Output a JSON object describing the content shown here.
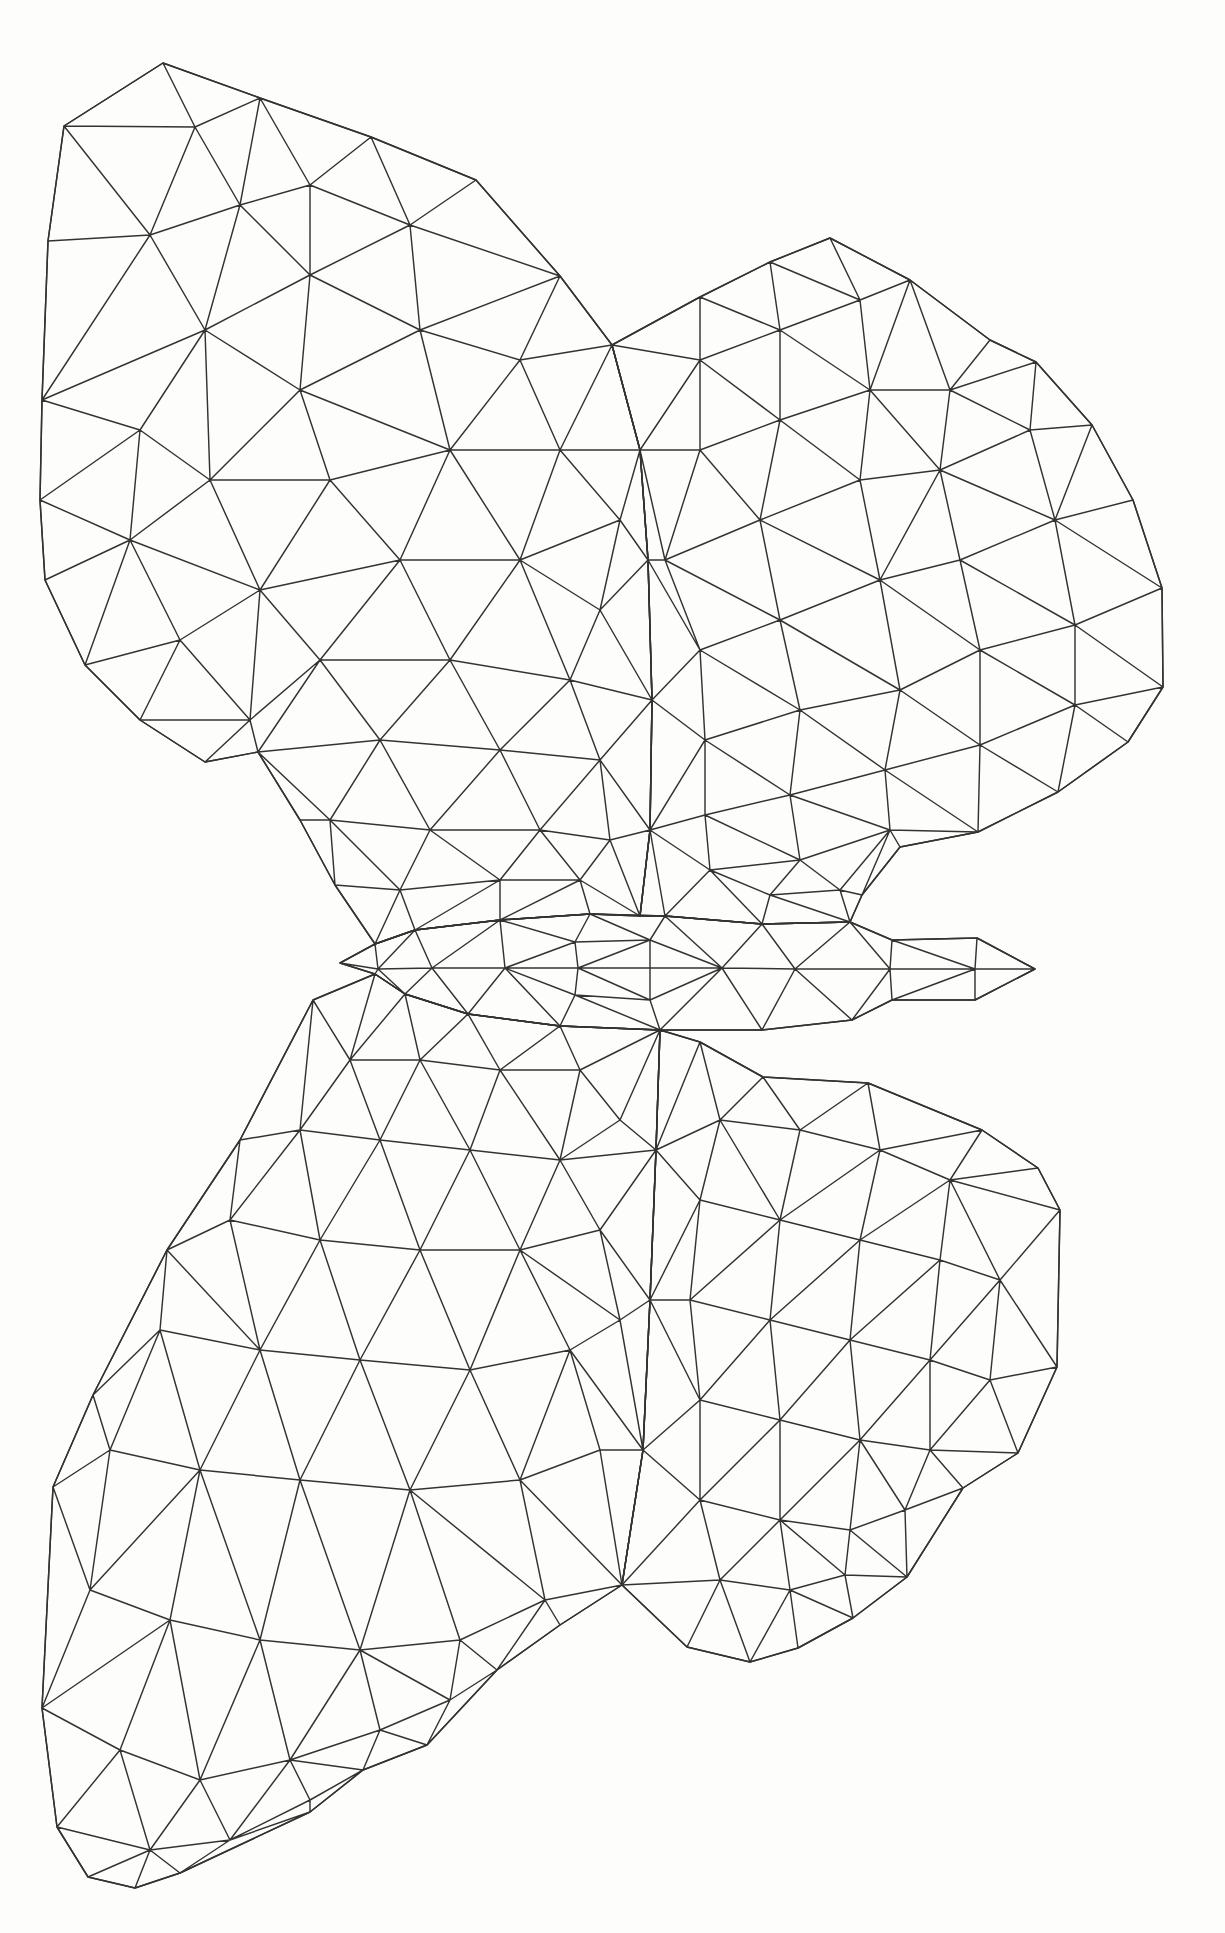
{
  "artwork": {
    "description": "low-poly triangulated butterfly line drawing, black ink wireframe on white paper",
    "background_color": "#fdfdfc",
    "stroke_color": "#333333",
    "stroke_width": 1.45,
    "canvas": {
      "width": 1225,
      "height": 1933
    },
    "parts": [
      {
        "id": "upper-left-wing",
        "label": "upper left wing",
        "outline": [
          [
            163,
            63
          ],
          [
            260,
            98
          ],
          [
            371,
            137
          ],
          [
            476,
            180
          ],
          [
            560,
            276
          ],
          [
            612,
            345
          ],
          [
            640,
            450
          ],
          [
            648,
            560
          ],
          [
            652,
            700
          ],
          [
            650,
            830
          ],
          [
            640,
            916
          ],
          [
            590,
            914
          ],
          [
            500,
            920
          ],
          [
            415,
            930
          ],
          [
            375,
            944
          ],
          [
            335,
            885
          ],
          [
            300,
            820
          ],
          [
            258,
            752
          ],
          [
            205,
            762
          ],
          [
            140,
            720
          ],
          [
            85,
            665
          ],
          [
            45,
            580
          ],
          [
            40,
            500
          ],
          [
            42,
            400
          ],
          [
            48,
            241
          ],
          [
            64,
            126
          ]
        ],
        "inner": [
          [
            195,
            127
          ],
          [
            310,
            185
          ],
          [
            240,
            205
          ],
          [
            410,
            225
          ],
          [
            150,
            235
          ],
          [
            310,
            275
          ],
          [
            205,
            330
          ],
          [
            420,
            330
          ],
          [
            300,
            390
          ],
          [
            140,
            430
          ],
          [
            520,
            360
          ],
          [
            450,
            450
          ],
          [
            560,
            450
          ],
          [
            210,
            480
          ],
          [
            330,
            480
          ],
          [
            620,
            520
          ],
          [
            130,
            540
          ],
          [
            400,
            560
          ],
          [
            520,
            560
          ],
          [
            260,
            590
          ],
          [
            600,
            610
          ],
          [
            180,
            640
          ],
          [
            320,
            660
          ],
          [
            450,
            660
          ],
          [
            570,
            680
          ],
          [
            250,
            720
          ],
          [
            380,
            740
          ],
          [
            500,
            750
          ],
          [
            600,
            760
          ],
          [
            330,
            820
          ],
          [
            430,
            830
          ],
          [
            540,
            830
          ],
          [
            610,
            840
          ],
          [
            400,
            890
          ],
          [
            500,
            880
          ],
          [
            580,
            880
          ]
        ]
      },
      {
        "id": "upper-right-wing",
        "label": "upper right wing",
        "outline": [
          [
            612,
            345
          ],
          [
            700,
            297
          ],
          [
            770,
            262
          ],
          [
            830,
            238
          ],
          [
            910,
            280
          ],
          [
            990,
            340
          ],
          [
            1036,
            362
          ],
          [
            1092,
            425
          ],
          [
            1133,
            500
          ],
          [
            1162,
            588
          ],
          [
            1163,
            687
          ],
          [
            1128,
            742
          ],
          [
            1058,
            792
          ],
          [
            978,
            832
          ],
          [
            900,
            847
          ],
          [
            862,
            895
          ],
          [
            850,
            922
          ],
          [
            762,
            924
          ],
          [
            665,
            916
          ],
          [
            640,
            916
          ],
          [
            650,
            830
          ],
          [
            652,
            700
          ],
          [
            648,
            560
          ],
          [
            640,
            450
          ]
        ],
        "inner": [
          [
            700,
            360
          ],
          [
            780,
            330
          ],
          [
            860,
            300
          ],
          [
            950,
            390
          ],
          [
            1030,
            430
          ],
          [
            870,
            390
          ],
          [
            780,
            420
          ],
          [
            700,
            450
          ],
          [
            940,
            470
          ],
          [
            1055,
            520
          ],
          [
            860,
            480
          ],
          [
            760,
            520
          ],
          [
            665,
            560
          ],
          [
            960,
            560
          ],
          [
            1075,
            625
          ],
          [
            880,
            580
          ],
          [
            780,
            620
          ],
          [
            700,
            650
          ],
          [
            980,
            650
          ],
          [
            1075,
            705
          ],
          [
            900,
            690
          ],
          [
            800,
            710
          ],
          [
            705,
            740
          ],
          [
            980,
            745
          ],
          [
            885,
            770
          ],
          [
            790,
            795
          ],
          [
            705,
            815
          ],
          [
            890,
            830
          ],
          [
            800,
            860
          ],
          [
            710,
            870
          ],
          [
            770,
            895
          ],
          [
            840,
            890
          ]
        ]
      },
      {
        "id": "body",
        "label": "body spindle with center axis and head dart",
        "outline": [
          [
            340,
            963
          ],
          [
            375,
            944
          ],
          [
            415,
            930
          ],
          [
            500,
            920
          ],
          [
            590,
            914
          ],
          [
            665,
            916
          ],
          [
            762,
            924
          ],
          [
            850,
            922
          ],
          [
            892,
            940
          ],
          [
            977,
            938
          ],
          [
            1035,
            969
          ],
          [
            975,
            1000
          ],
          [
            892,
            1000
          ],
          [
            852,
            1020
          ],
          [
            762,
            1030
          ],
          [
            660,
            1030
          ],
          [
            560,
            1026
          ],
          [
            468,
            1014
          ],
          [
            405,
            994
          ],
          [
            375,
            974
          ]
        ],
        "inner": [
          [
            378,
            969
          ],
          [
            432,
            968
          ],
          [
            505,
            968
          ],
          [
            578,
            968
          ],
          [
            650,
            968
          ],
          [
            722,
            968
          ],
          [
            795,
            969
          ],
          [
            890,
            969
          ],
          [
            975,
            969
          ],
          [
            575,
            942
          ],
          [
            650,
            940
          ],
          [
            575,
            995
          ],
          [
            650,
            1000
          ]
        ]
      },
      {
        "id": "lower-left-wing",
        "label": "lower left wing",
        "outline": [
          [
            375,
            974
          ],
          [
            405,
            994
          ],
          [
            468,
            1014
          ],
          [
            560,
            1026
          ],
          [
            660,
            1030
          ],
          [
            656,
            1150
          ],
          [
            650,
            1300
          ],
          [
            643,
            1450
          ],
          [
            622,
            1585
          ],
          [
            560,
            1625
          ],
          [
            497,
            1670
          ],
          [
            427,
            1745
          ],
          [
            363,
            1770
          ],
          [
            310,
            1812
          ],
          [
            180,
            1873
          ],
          [
            135,
            1888
          ],
          [
            88,
            1877
          ],
          [
            57,
            1827
          ],
          [
            42,
            1708
          ],
          [
            53,
            1487
          ],
          [
            93,
            1395
          ],
          [
            167,
            1250
          ],
          [
            240,
            1140
          ],
          [
            313,
            1000
          ]
        ],
        "inner": [
          [
            350,
            1060
          ],
          [
            420,
            1060
          ],
          [
            500,
            1070
          ],
          [
            580,
            1070
          ],
          [
            300,
            1130
          ],
          [
            380,
            1140
          ],
          [
            470,
            1150
          ],
          [
            560,
            1160
          ],
          [
            620,
            1120
          ],
          [
            230,
            1220
          ],
          [
            320,
            1240
          ],
          [
            420,
            1250
          ],
          [
            520,
            1250
          ],
          [
            600,
            1230
          ],
          [
            160,
            1330
          ],
          [
            260,
            1350
          ],
          [
            360,
            1360
          ],
          [
            470,
            1370
          ],
          [
            570,
            1350
          ],
          [
            620,
            1320
          ],
          [
            110,
            1450
          ],
          [
            200,
            1470
          ],
          [
            300,
            1480
          ],
          [
            410,
            1490
          ],
          [
            520,
            1480
          ],
          [
            600,
            1450
          ],
          [
            90,
            1590
          ],
          [
            170,
            1620
          ],
          [
            260,
            1640
          ],
          [
            360,
            1650
          ],
          [
            460,
            1640
          ],
          [
            545,
            1600
          ],
          [
            120,
            1750
          ],
          [
            200,
            1780
          ],
          [
            290,
            1760
          ],
          [
            380,
            1730
          ],
          [
            450,
            1700
          ],
          [
            150,
            1850
          ],
          [
            230,
            1840
          ],
          [
            310,
            1800
          ]
        ]
      },
      {
        "id": "lower-right-wing",
        "label": "lower right wing",
        "outline": [
          [
            660,
            1030
          ],
          [
            700,
            1042
          ],
          [
            763,
            1077
          ],
          [
            868,
            1083
          ],
          [
            982,
            1130
          ],
          [
            1038,
            1168
          ],
          [
            1060,
            1210
          ],
          [
            1057,
            1367
          ],
          [
            1018,
            1453
          ],
          [
            963,
            1488
          ],
          [
            907,
            1577
          ],
          [
            853,
            1618
          ],
          [
            798,
            1648
          ],
          [
            750,
            1662
          ],
          [
            687,
            1647
          ],
          [
            622,
            1585
          ],
          [
            643,
            1450
          ],
          [
            650,
            1300
          ],
          [
            656,
            1150
          ]
        ],
        "inner": [
          [
            720,
            1120
          ],
          [
            800,
            1130
          ],
          [
            880,
            1150
          ],
          [
            950,
            1180
          ],
          [
            700,
            1200
          ],
          [
            780,
            1220
          ],
          [
            860,
            1240
          ],
          [
            940,
            1260
          ],
          [
            1000,
            1280
          ],
          [
            690,
            1300
          ],
          [
            770,
            1320
          ],
          [
            850,
            1340
          ],
          [
            930,
            1360
          ],
          [
            990,
            1380
          ],
          [
            700,
            1400
          ],
          [
            780,
            1420
          ],
          [
            860,
            1440
          ],
          [
            930,
            1450
          ],
          [
            700,
            1500
          ],
          [
            780,
            1520
          ],
          [
            850,
            1530
          ],
          [
            905,
            1510
          ],
          [
            720,
            1580
          ],
          [
            790,
            1590
          ],
          [
            845,
            1575
          ]
        ]
      }
    ]
  }
}
